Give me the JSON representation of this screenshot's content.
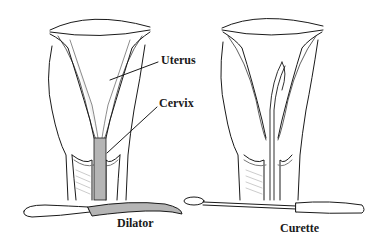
{
  "diagram": {
    "labels": {
      "uterus": "Uterus",
      "cervix": "Cervix",
      "dilator": "Dilator",
      "curette": "Curette"
    },
    "panels": [
      {
        "name": "dilation",
        "instrument": "Dilator"
      },
      {
        "name": "curettage",
        "instrument": "Curette"
      }
    ],
    "colors": {
      "line": "#1a1a1a",
      "instrument_fill": "#b5b5b5",
      "shade": "#9a9a9a"
    }
  }
}
